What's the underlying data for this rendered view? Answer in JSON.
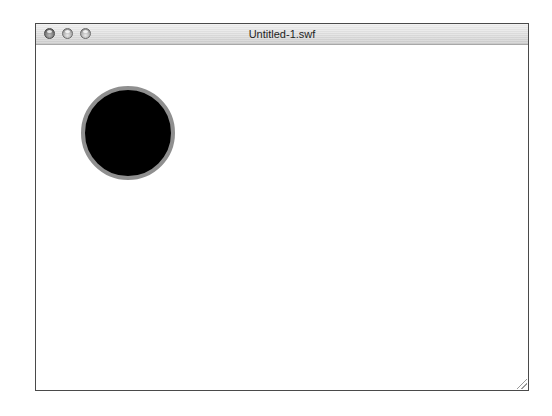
{
  "window": {
    "title": "Untitled-1.swf",
    "controls": [
      {
        "name": "close",
        "icon": "close-button-icon"
      },
      {
        "name": "minimize",
        "icon": "minimize-button-icon"
      },
      {
        "name": "zoom",
        "icon": "zoom-button-icon"
      }
    ],
    "border_color": "#4a4a4a"
  },
  "stage": {
    "background": "#ffffff",
    "shapes": [
      {
        "type": "circle",
        "fill": "#000000",
        "stroke": "#8f8f8f",
        "diameter": 94
      }
    ]
  }
}
